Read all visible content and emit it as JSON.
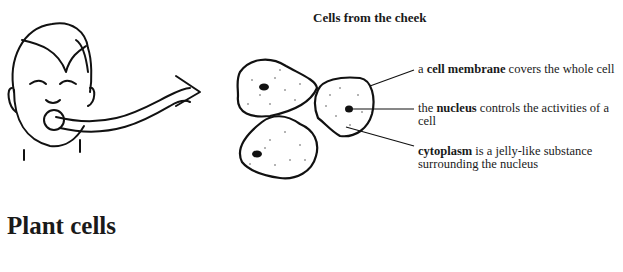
{
  "diagram": {
    "title": "Cells from the cheek",
    "labels": [
      {
        "pre": "a ",
        "term": "cell membrane",
        "post": " covers the whole cell"
      },
      {
        "pre": "the ",
        "term": "nucleus",
        "post": " controls the activities of a cell"
      },
      {
        "pre": "",
        "term": "cytoplasm",
        "post": " is a jelly-like substance surrounding the nucleus"
      }
    ],
    "illustrations": [
      "face-with-swab-icon",
      "arrow-icon",
      "cheek-cells-icon"
    ]
  },
  "section": {
    "heading": "Plant cells"
  }
}
